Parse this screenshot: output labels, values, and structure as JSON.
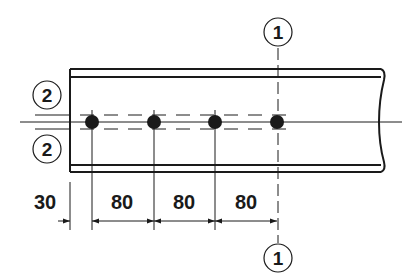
{
  "drawing": {
    "type": "bolted beam splice / bolt row layout",
    "beam": {
      "left_x": 70,
      "right_x": 383,
      "top_outer_y": 69,
      "top_inner_y": 77,
      "bottom_inner_y": 165,
      "bottom_outer_y": 172,
      "end_style_right": "wavy-break-line"
    },
    "centerline_y": 122,
    "gauge_lines_y": [
      115,
      129
    ],
    "bolts": [
      {
        "x": 92,
        "y": 122
      },
      {
        "x": 154,
        "y": 122
      },
      {
        "x": 215,
        "y": 122
      },
      {
        "x": 277,
        "y": 122
      }
    ],
    "section_markers": [
      {
        "id": "section-1-top",
        "label": "1",
        "cx": 278,
        "cy": 32
      },
      {
        "id": "section-1-bottom",
        "label": "1",
        "cx": 278,
        "cy": 258
      },
      {
        "id": "section-2-upper",
        "label": "2",
        "cx": 47,
        "cy": 95
      },
      {
        "id": "section-2-lower",
        "label": "2",
        "cx": 47,
        "cy": 149
      }
    ],
    "dimensions": {
      "line_y": 221,
      "items": [
        {
          "label": "30",
          "text_x": 45,
          "from_x": 70,
          "to_x": 92,
          "style": "outside-arrows"
        },
        {
          "label": "80",
          "text_x": 122,
          "from_x": 92,
          "to_x": 154,
          "style": "inside-arrows"
        },
        {
          "label": "80",
          "text_x": 184,
          "from_x": 154,
          "to_x": 215,
          "style": "inside-arrows"
        },
        {
          "label": "80",
          "text_x": 246,
          "from_x": 215,
          "to_x": 277,
          "style": "inside-arrows"
        }
      ]
    },
    "colors": {
      "ink": "#1a1a1a",
      "background": "#ffffff"
    }
  }
}
